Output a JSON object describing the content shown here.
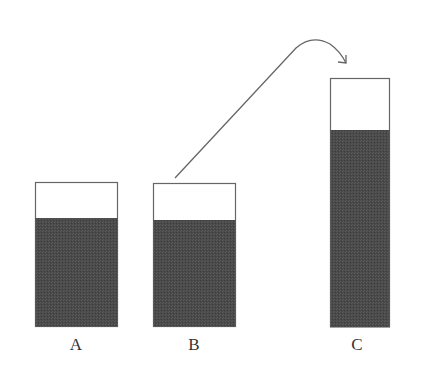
{
  "diagram": {
    "colors": {
      "outline": "#666666",
      "fill": "#4a4a4a",
      "background": "#ffffff",
      "arrow": "#666666"
    },
    "containers": [
      {
        "id": "A",
        "label": "A",
        "x": 35,
        "top": 182,
        "width": 82,
        "bottom": 326,
        "fill_top": 218
      },
      {
        "id": "B",
        "label": "B",
        "x": 153,
        "top": 183,
        "width": 82,
        "bottom": 326,
        "fill_top": 220
      },
      {
        "id": "C",
        "label": "C",
        "x": 330,
        "top": 78,
        "width": 59,
        "bottom": 327,
        "fill_top": 130
      }
    ],
    "arrow": {
      "from": "B",
      "to": "C",
      "start": [
        175,
        178
      ],
      "apex": [
        310,
        42
      ],
      "end": [
        346,
        63
      ]
    }
  }
}
